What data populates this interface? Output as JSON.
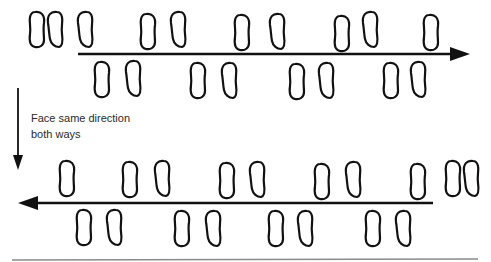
{
  "diagram": {
    "title": "",
    "annotation": {
      "line1": "Face same direction",
      "line2": "both ways"
    },
    "colors": {
      "stroke": "#111111",
      "background": "#ffffff",
      "rule": "#888888"
    },
    "top_pass": {
      "direction": "right",
      "arrow": {
        "x1": 78,
        "x2": 470,
        "y": 54
      },
      "start_pair": [
        {
          "x": 37,
          "y": 29,
          "side": "left"
        },
        {
          "x": 55,
          "y": 29,
          "side": "right"
        }
      ],
      "steps_above": [
        {
          "x": 85,
          "y": 29,
          "side": "right"
        },
        {
          "x": 148,
          "y": 31,
          "side": "left"
        },
        {
          "x": 178,
          "y": 29,
          "side": "right"
        },
        {
          "x": 242,
          "y": 32,
          "side": "left"
        },
        {
          "x": 277,
          "y": 31,
          "side": "right"
        },
        {
          "x": 342,
          "y": 33,
          "side": "left"
        },
        {
          "x": 370,
          "y": 29,
          "side": "right"
        },
        {
          "x": 431,
          "y": 32,
          "side": "left"
        }
      ],
      "steps_below": [
        {
          "x": 102,
          "y": 79,
          "side": "left"
        },
        {
          "x": 133,
          "y": 78,
          "side": "right"
        },
        {
          "x": 198,
          "y": 80,
          "side": "left"
        },
        {
          "x": 229,
          "y": 80,
          "side": "right"
        },
        {
          "x": 297,
          "y": 81,
          "side": "left"
        },
        {
          "x": 326,
          "y": 80,
          "side": "right"
        },
        {
          "x": 391,
          "y": 80,
          "side": "left"
        },
        {
          "x": 418,
          "y": 79,
          "side": "right"
        }
      ]
    },
    "transition_arrow": {
      "x": 18,
      "y1": 88,
      "y2": 168,
      "direction": "down"
    },
    "bottom_pass": {
      "direction": "left",
      "arrow": {
        "x1": 18,
        "x2": 433,
        "y": 203
      },
      "steps_above": [
        {
          "x": 67,
          "y": 178,
          "side": "left"
        },
        {
          "x": 130,
          "y": 179,
          "side": "left"
        },
        {
          "x": 162,
          "y": 178,
          "side": "right"
        },
        {
          "x": 227,
          "y": 180,
          "side": "left"
        },
        {
          "x": 257,
          "y": 179,
          "side": "right"
        },
        {
          "x": 322,
          "y": 181,
          "side": "left"
        },
        {
          "x": 353,
          "y": 179,
          "side": "right"
        },
        {
          "x": 418,
          "y": 181,
          "side": "left"
        }
      ],
      "end_pair": [
        {
          "x": 453,
          "y": 178,
          "side": "left"
        },
        {
          "x": 471,
          "y": 178,
          "side": "right"
        }
      ],
      "steps_below": [
        {
          "x": 84,
          "y": 227,
          "side": "left"
        },
        {
          "x": 114,
          "y": 227,
          "side": "right"
        },
        {
          "x": 182,
          "y": 228,
          "side": "left"
        },
        {
          "x": 213,
          "y": 228,
          "side": "right"
        },
        {
          "x": 276,
          "y": 228,
          "side": "left"
        },
        {
          "x": 305,
          "y": 228,
          "side": "right"
        },
        {
          "x": 373,
          "y": 228,
          "side": "left"
        },
        {
          "x": 403,
          "y": 228,
          "side": "right"
        }
      ]
    },
    "bottom_rule": {
      "x1": 12,
      "x2": 478,
      "y": 260
    }
  }
}
